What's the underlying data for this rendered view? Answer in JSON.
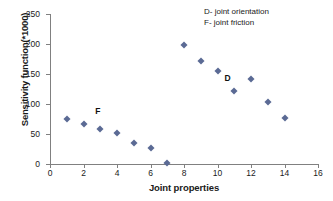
{
  "chart_data": {
    "type": "scatter",
    "title": "",
    "xlabel": "Joint properties",
    "ylabel": "Sensitivity function(*1000)",
    "xlim": [
      0,
      16
    ],
    "ylim": [
      0,
      250
    ],
    "xticks": [
      0,
      2,
      4,
      6,
      8,
      10,
      12,
      14,
      16
    ],
    "yticks": [
      0,
      50,
      100,
      150,
      200,
      250
    ],
    "grid": false,
    "legend_position": "top-right",
    "marker": "diamond",
    "marker_color": "#5b6a94",
    "x": [
      1,
      2,
      3,
      4,
      5,
      6,
      7,
      8,
      9,
      10,
      11,
      12,
      13,
      14
    ],
    "values": [
      75,
      66,
      59,
      51,
      35,
      27,
      1,
      198,
      171,
      155,
      121,
      142,
      103,
      77
    ],
    "series": [
      {
        "name": "F - joint friction",
        "x": [
          1,
          2,
          3,
          4,
          5,
          6,
          7
        ],
        "values": [
          75,
          66,
          59,
          51,
          35,
          27,
          1
        ]
      },
      {
        "name": "D - joint orientation",
        "x": [
          8,
          9,
          10,
          11,
          12,
          13,
          14
        ],
        "values": [
          198,
          171,
          155,
          121,
          142,
          103,
          77
        ]
      }
    ],
    "annotations": [
      {
        "text": "F",
        "x": 2.85,
        "y": 88
      },
      {
        "text": "D",
        "x": 10.6,
        "y": 143
      }
    ],
    "notes": [
      "D- joint orientation",
      "F- joint  friction"
    ]
  }
}
